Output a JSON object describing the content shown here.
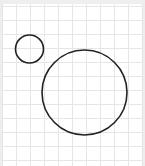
{
  "canvas": {
    "width": 141,
    "height": 162,
    "background": "#ffffff",
    "grid": {
      "spacing": 14,
      "offset_x": 0,
      "offset_y": 2,
      "color": "#e6e6e6"
    }
  },
  "shapes": [
    {
      "type": "circle",
      "name": "small-circle",
      "cx": 27.5,
      "cy": 45,
      "r": 14,
      "stroke": "#222222",
      "stroke_width": 1.6,
      "fill": "none"
    },
    {
      "type": "circle",
      "name": "large-circle",
      "cx": 82.5,
      "cy": 88.5,
      "r": 42.5,
      "stroke": "#222222",
      "stroke_width": 1.6,
      "fill": "none"
    }
  ]
}
